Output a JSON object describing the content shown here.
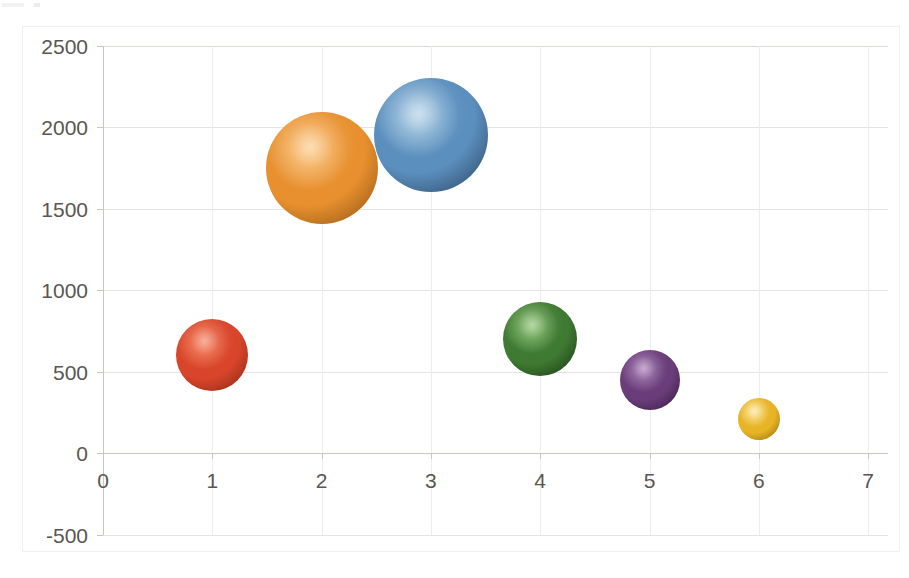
{
  "chart_data": {
    "type": "scatter",
    "title": "",
    "subtitle": "",
    "xlabel": "",
    "ylabel": "",
    "xlim": [
      0,
      7
    ],
    "ylim": [
      -500,
      2500
    ],
    "grid": true,
    "legend": "none",
    "x_ticks": [
      "0",
      "1",
      "2",
      "3",
      "4",
      "5",
      "6",
      "7"
    ],
    "y_ticks": [
      "2500",
      "2000",
      "1500",
      "1000",
      "500",
      "0",
      "-500"
    ],
    "x_tick_values": [
      0,
      1,
      2,
      3,
      4,
      5,
      6,
      7
    ],
    "y_tick_values": [
      2500,
      2000,
      1500,
      1000,
      500,
      0,
      -500
    ],
    "series": [
      {
        "name": "Series 1",
        "points": [
          {
            "label": "bubble-red",
            "x": 1,
            "y": 600,
            "size": 36,
            "color": "#D8452A",
            "shade": "#8E2A16",
            "highlight": "#F4714A"
          },
          {
            "label": "bubble-orange",
            "x": 2,
            "y": 1750,
            "size": 56,
            "color": "#E8902F",
            "shade": "#9A5A16",
            "highlight": "#FBC37A"
          },
          {
            "label": "bubble-blue",
            "x": 3,
            "y": 1950,
            "size": 57,
            "color": "#5B8FBE",
            "shade": "#2F4C6B",
            "highlight": "#A8CBE4"
          },
          {
            "label": "bubble-green",
            "x": 4,
            "y": 700,
            "size": 37,
            "color": "#3F7A32",
            "shade": "#1E3E17",
            "highlight": "#7CBA60"
          },
          {
            "label": "bubble-purple",
            "x": 5,
            "y": 450,
            "size": 30,
            "color": "#6A3D7A",
            "shade": "#3A1F46",
            "highlight": "#9A6BAA"
          },
          {
            "label": "bubble-yellow",
            "x": 6,
            "y": 210,
            "size": 21,
            "color": "#E8B426",
            "shade": "#9A7510",
            "highlight": "#FBE189"
          }
        ]
      }
    ]
  },
  "colors": {
    "background": "#ffffff",
    "gridline": "#e6e4e0",
    "axis_line": "#c9c6c0",
    "tick_text": "#595652",
    "frame_border": "#f0efed"
  }
}
